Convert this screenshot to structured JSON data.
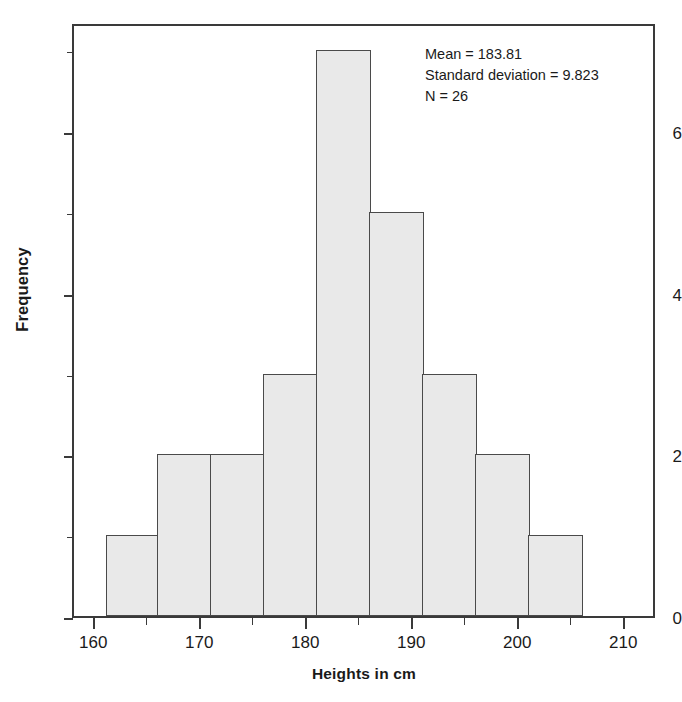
{
  "chart_data": {
    "type": "bar",
    "chart_subtype": "histogram",
    "title": "",
    "xlabel": "Heights in cm",
    "ylabel": "Frequency",
    "xlim": [
      158,
      213
    ],
    "ylim": [
      0,
      7.35
    ],
    "grid": false,
    "legend": null,
    "bin_width": 5,
    "bin_edges": [
      161,
      166,
      171,
      176,
      181,
      186,
      191,
      196,
      201,
      206
    ],
    "categories": [
      "161-166",
      "166-171",
      "171-176",
      "176-181",
      "181-186",
      "186-191",
      "191-196",
      "196-201",
      "201-206"
    ],
    "values": [
      1,
      2,
      2,
      3,
      7,
      5,
      3,
      2,
      1
    ],
    "bar_fill_color": "#e9e9e9",
    "bar_edge_color": "#4a4a4a",
    "x_major_ticks": [
      160,
      170,
      180,
      190,
      200,
      210
    ],
    "x_major_tick_labels": [
      "160",
      "170",
      "180",
      "190",
      "200",
      "210"
    ],
    "x_minor_ticks": [
      165,
      175,
      185,
      195,
      205
    ],
    "y_major_ticks": [
      0,
      2,
      4,
      6
    ],
    "y_major_tick_labels": [
      "0",
      "2",
      "4",
      "6"
    ],
    "y_minor_ticks": [
      1,
      3,
      5,
      7
    ],
    "annotations": [
      "Mean = 183.81",
      "Standard deviation = 9.823",
      "N = 26"
    ],
    "statistics": {
      "mean": 183.81,
      "standard_deviation": 9.823,
      "n": 26
    }
  },
  "axis_titles": {
    "x": "Heights in cm",
    "y": "Frequency"
  },
  "annotation": {
    "mean_line": "Mean = 183.81",
    "sd_line": "Standard deviation = 9.823",
    "n_line": "N = 26"
  }
}
